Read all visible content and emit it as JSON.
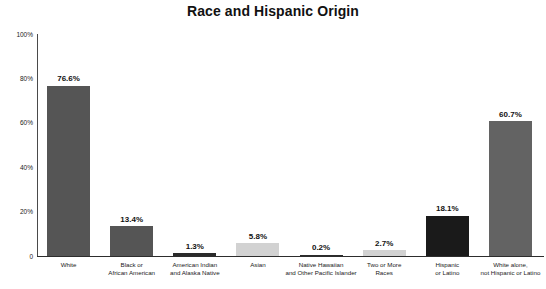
{
  "chart_data": {
    "type": "bar",
    "title": "Race and Hispanic Origin",
    "xlabel": "",
    "ylabel": "",
    "ylim": [
      0,
      100
    ],
    "grid": false,
    "legend": "none",
    "ytick_labels": [
      "100%",
      "80%",
      "60%",
      "40%",
      "20%",
      "0"
    ],
    "ytick_values": [
      100,
      80,
      60,
      40,
      20,
      0
    ],
    "categories": [
      "White",
      "Black or African American",
      "American Indian and Alaska Native",
      "Asian",
      "Native Hawaiian and Other Pacific Islander",
      "Two or More Races",
      "Hispanic or Latino",
      "White alone, not Hispanic or Latino"
    ],
    "category_lines": [
      [
        "White"
      ],
      [
        "Black or",
        "African American"
      ],
      [
        "American Indian",
        "and Alaska Native"
      ],
      [
        "Asian"
      ],
      [
        "Native Hawaiian",
        "and Other Pacific Islander"
      ],
      [
        "Two or More",
        "Races"
      ],
      [
        "Hispanic",
        "or Latino"
      ],
      [
        "White alone,",
        "not Hispanic or Latino"
      ]
    ],
    "values": [
      76.6,
      13.4,
      1.3,
      5.8,
      0.2,
      2.7,
      18.1,
      60.7
    ],
    "value_labels": [
      "76.6%",
      "13.4%",
      "1.3%",
      "5.8%",
      "0.2%",
      "2.7%",
      "18.1%",
      "60.7%"
    ],
    "bar_colors": [
      "#555555",
      "#555555",
      "#2b2b2b",
      "#d2d2d2",
      "#2b2b2b",
      "#d2d2d2",
      "#1a1a1a",
      "#636363"
    ]
  },
  "colors": {
    "axis": "#2d2d2d",
    "text": "#111111",
    "background": "#ffffff"
  }
}
